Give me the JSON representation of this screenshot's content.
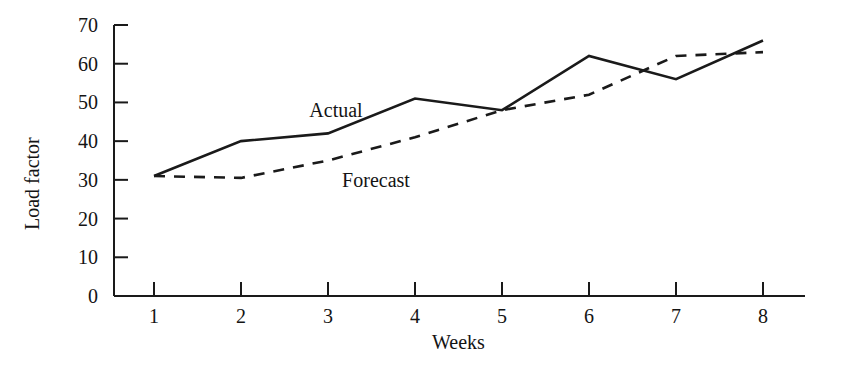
{
  "chart_data": {
    "type": "line",
    "title": "",
    "xlabel": "Weeks",
    "ylabel": "Load factor",
    "x": [
      1,
      2,
      3,
      4,
      5,
      6,
      7,
      8
    ],
    "categories": [
      "1",
      "2",
      "3",
      "4",
      "5",
      "6",
      "7",
      "8"
    ],
    "xlim": [
      1,
      8
    ],
    "ylim": [
      0,
      70
    ],
    "ytick_labels": [
      "0",
      "10",
      "20",
      "30",
      "40",
      "50",
      "60",
      "70"
    ],
    "yticks": [
      0,
      10,
      20,
      30,
      40,
      50,
      60,
      70
    ],
    "xtick_labels": [
      "1",
      "2",
      "3",
      "4",
      "5",
      "6",
      "7",
      "8"
    ],
    "grid": false,
    "legend_position": "inline-annotations",
    "series": [
      {
        "name": "Actual",
        "style": "solid",
        "color": "#1a1a1a",
        "values": [
          31,
          40,
          42,
          51,
          48,
          62,
          56,
          66
        ]
      },
      {
        "name": "Forecast",
        "style": "dashed",
        "color": "#1a1a1a",
        "values": [
          31,
          30.5,
          35,
          41,
          48,
          52,
          62,
          63
        ]
      }
    ],
    "annotations": [
      {
        "text": "Actual",
        "x_px": 336,
        "y_px": 110
      },
      {
        "text": "Forecast",
        "x_px": 376,
        "y_px": 180
      }
    ]
  },
  "axis": {
    "y_title": "Load factor",
    "x_title": "Weeks"
  },
  "series_labels": {
    "actual": "Actual",
    "forecast": "Forecast"
  }
}
